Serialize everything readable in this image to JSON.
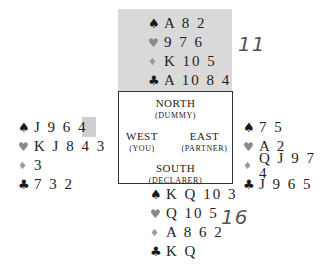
{
  "hands": {
    "north": {
      "spades": "A82",
      "hearts": "976",
      "diamonds": "K105",
      "clubs": "A1084"
    },
    "west": {
      "spades": "J964",
      "hearts": "KJ84",
      "hearts_highlighted_card": "3",
      "diamonds": "3",
      "clubs": "732"
    },
    "east": {
      "spades": "75",
      "hearts": "A2",
      "diamonds": "QJ974",
      "clubs": "J965"
    },
    "south": {
      "spades": "KQ103",
      "hearts": "Q105",
      "diamonds": "A862",
      "clubs": "KQ"
    }
  },
  "display": {
    "north": [
      "A 8 2",
      "9 7 6",
      "K 10 5",
      "A 10 8 4"
    ],
    "west": [
      "J 9 6 4",
      "K J 8 4 ",
      "3",
      "7 3 2"
    ],
    "west_highlight": "3",
    "east": [
      "7 5",
      "A 2",
      "Q J 9 7 4",
      "J 9 6 5"
    ],
    "south": [
      "K Q 10 3",
      "Q 10 5",
      "A 8 6 2",
      "K Q"
    ]
  },
  "suits": {
    "spade": "♠",
    "heart": "♥",
    "diamond": "♦",
    "club": "♣"
  },
  "seats": {
    "north": {
      "name": "NORTH",
      "role": "(DUMMY)"
    },
    "west": {
      "name": "WEST",
      "role": "(YOU)"
    },
    "east": {
      "name": "EAST",
      "role": "(PARTNER)"
    },
    "south": {
      "name": "SOUTH",
      "role": "(DECLARER)"
    }
  },
  "annotations": {
    "north_points": "11",
    "south_points": "16"
  },
  "colors": {
    "dummy_panel": "#d9d9d9",
    "highlight": "#cfcfcf",
    "red_suit": "#8a8a8a"
  }
}
